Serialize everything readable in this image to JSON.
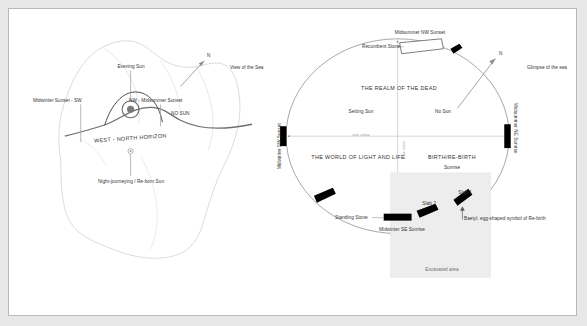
{
  "figure": {
    "title_left": "Rock-face horizon sunset diagram",
    "title_right": "Recumbent stone circle plan"
  },
  "left_panel": {
    "labels": {
      "evening_sun": "Evening Sun",
      "midwinter_sunset_sw": "Midwinter Sunset - SW",
      "nw_midsummer_sunset": "NW - Midsummer Sunset",
      "no_sun": "NO SUN",
      "west_north_horizon": "WEST - NORTH HORIZON",
      "night_journeying": "Night-journeying / Re-born Sun",
      "north_arrow": "N",
      "view_of_the_sea": "View of the Sea"
    }
  },
  "right_panel": {
    "labels": {
      "midsummer_nw_sunset": "Midsummer  NW  Sunset",
      "recumbent_stone": "Recumbent Stone",
      "realm_of_the_dead": "THE REALM OF THE DEAD",
      "setting_sun": "Setting Sun",
      "no_sun": "No Sun",
      "north_arrow": "N",
      "glimpse_of_the_sea": "Glimpse of the sea",
      "midwinter_sw_sunset": "Midwinter SW Sunset",
      "midsummer_ne_sunrise": "Midsummer NE Sunrise",
      "major_axis": "major axis",
      "minor_axis": "minor axis",
      "world_of_light_and_life": "THE WORLD OF LIGHT AND LIFE.",
      "birth_rebirth": "BIRTH/RE-BIRTH",
      "sunrise": "Sunrise",
      "slab_1": "Slab 1",
      "slab_2": "Slab 2",
      "standing_stone": "Standing Stone",
      "midwinter_se_sunrise": "Midwinter SE Sunrise",
      "baetyl": "Baetyl, egg-shaped symbol of Re-birth",
      "excavated_area": "Excavated area"
    }
  },
  "colors": {
    "page_background": "#e8e8e8",
    "frame_background": "#ffffff",
    "frame_border": "#b8b8b8",
    "text": "#313131",
    "muted_text": "#8a8a8a",
    "stone_fill": "#000000",
    "ellipse_stroke": "#9b9b9b",
    "rock_outline": "#c9c9c9",
    "horizon": "#6a6a6a",
    "excavated_fill": "#ededed"
  }
}
